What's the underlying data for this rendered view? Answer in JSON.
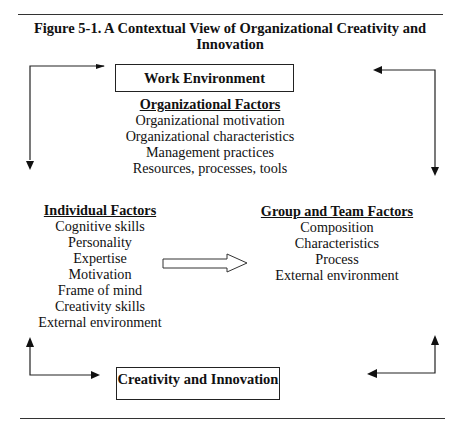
{
  "figure": {
    "title_line1": "Figure 5-1.  A Contextual View of Organizational Creativity and",
    "title_line2": "Innovation"
  },
  "boxes": {
    "work_environment": "Work Environment",
    "creativity_innovation": "Creativity and Innovation"
  },
  "organizational_factors": {
    "heading": "Organizational Factors",
    "items": [
      "Organizational motivation",
      "Organizational characteristics",
      "Management practices",
      "Resources, processes, tools"
    ]
  },
  "individual_factors": {
    "heading": "Individual Factors",
    "items": [
      "Cognitive skills",
      "Personality",
      "Expertise",
      "Motivation",
      "Frame of mind",
      "Creativity skills",
      "External environment"
    ]
  },
  "group_team_factors": {
    "heading": "Group and Team Factors",
    "items": [
      "Composition",
      "Characteristics",
      "Process",
      "External environment"
    ]
  },
  "arrows": [
    {
      "name": "left-top-loop",
      "direction": "down",
      "from": "Work Environment",
      "to": "Individual Factors"
    },
    {
      "name": "right-top-loop",
      "direction": "down",
      "from": "Work Environment",
      "to": "Group and Team Factors"
    },
    {
      "name": "hollow-arrow",
      "direction": "right",
      "from": "Individual Factors",
      "to": "Group and Team Factors"
    },
    {
      "name": "left-bottom-loop",
      "direction": "up",
      "from": "Creativity and Innovation",
      "to": "Individual Factors"
    },
    {
      "name": "right-bottom-loop",
      "direction": "up",
      "from": "Creativity and Innovation",
      "to": "Group and Team Factors"
    }
  ]
}
